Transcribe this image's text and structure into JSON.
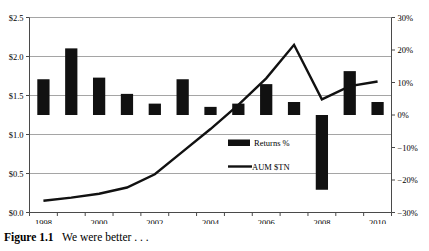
{
  "caption": {
    "label": "Figure 1.1",
    "text": "We were better . . ."
  },
  "chart_data": {
    "type": "bar",
    "title": "",
    "subtitle": "",
    "xlabel": "",
    "ylabel": "",
    "grid": true,
    "legend_position": "inside-center-bottom",
    "x": [
      1998,
      1999,
      2000,
      2001,
      2002,
      2003,
      2004,
      2005,
      2006,
      2007,
      2008,
      2009,
      2010
    ],
    "categories": [
      "1998",
      "1999",
      "2000",
      "2001",
      "2002",
      "2003",
      "2004",
      "2005",
      "2006",
      "2007",
      "2008",
      "2009",
      "2010"
    ],
    "tick_labels_x": [
      "1998",
      "2000",
      "2002",
      "2004",
      "2006",
      "2008",
      "2010"
    ],
    "axes": {
      "left": {
        "name": "AUM $TN",
        "ylim": [
          0.0,
          2.5
        ],
        "ticks": [
          0.0,
          0.5,
          1.0,
          1.5,
          2.0,
          2.5
        ],
        "tick_labels": [
          "$0.0",
          "$0.5",
          "$1.0",
          "$1.5",
          "$2.0",
          "$2.5"
        ]
      },
      "right": {
        "name": "Returns %",
        "ylim": [
          -30,
          30
        ],
        "ticks": [
          -30,
          -20,
          -10,
          0,
          10,
          20,
          30
        ],
        "tick_labels": [
          "−30%",
          "−20%",
          "−10%",
          "0%",
          "10%",
          "20%",
          "30%"
        ]
      }
    },
    "series": [
      {
        "name": "Returns %",
        "type": "bar",
        "axis": "right",
        "unit": "%",
        "color": "#111111",
        "values": [
          11.0,
          20.5,
          11.5,
          6.5,
          3.5,
          11.0,
          2.5,
          3.5,
          9.5,
          4.0,
          -23.0,
          13.5,
          4.0
        ]
      },
      {
        "name": "AUM $TN",
        "type": "line",
        "axis": "left",
        "unit": "$TN",
        "color": "#111111",
        "values": [
          0.15,
          0.19,
          0.24,
          0.32,
          0.49,
          0.78,
          1.07,
          1.38,
          1.72,
          2.15,
          1.45,
          1.62,
          1.68
        ]
      }
    ],
    "legend": [
      {
        "label": "Returns %",
        "marker": "bar-swatch"
      },
      {
        "label": "AUM $TN",
        "marker": "line-swatch"
      }
    ]
  }
}
